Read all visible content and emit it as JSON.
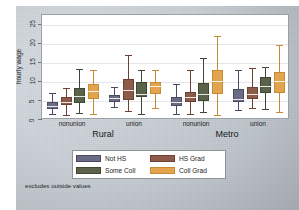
{
  "chart_data": {
    "type": "box",
    "title": "",
    "xlabel": "",
    "ylabel": "hourly wage",
    "ylim": [
      0,
      27.5
    ],
    "yticks": [
      0,
      5,
      10,
      15,
      20,
      25
    ],
    "ytick_labels": [
      "0",
      "5",
      "10",
      "15",
      "20",
      "25"
    ],
    "grid": true,
    "note": "excludes outside values",
    "legend_position": "bottom",
    "group_labels": [
      "nonunion",
      "union",
      "nonunion",
      "union"
    ],
    "super_group_labels": [
      "Rural",
      "Metro"
    ],
    "series": [
      {
        "name": "Not HS",
        "color": "#6b6b86",
        "edge": "#4a4a61",
        "boxes": [
          {
            "group": "Rural / nonunion",
            "whisker_low": 1.6,
            "q1": 2.9,
            "median": 3.6,
            "q3": 4.6,
            "whisker_high": 7.1
          },
          {
            "group": "Rural / union",
            "whisker_low": 3.4,
            "q1": 4.6,
            "median": 5.8,
            "q3": 6.6,
            "whisker_high": 8.7
          },
          {
            "group": "Metro / nonunion",
            "whisker_low": 1.6,
            "q1": 3.6,
            "median": 4.6,
            "q3": 6.1,
            "whisker_high": 9.4
          },
          {
            "group": "Metro / union",
            "whisker_low": 2.7,
            "q1": 4.6,
            "median": 5.6,
            "q3": 8.0,
            "whisker_high": 13.2
          }
        ]
      },
      {
        "name": "HS Grad",
        "color": "#8c5b49",
        "edge": "#6c4133",
        "boxes": [
          {
            "group": "Rural / nonunion",
            "whisker_low": 1.3,
            "q1": 3.8,
            "median": 4.7,
            "q3": 5.9,
            "whisker_high": 8.4
          },
          {
            "group": "Rural / union",
            "whisker_low": 2.4,
            "q1": 5.2,
            "median": 7.8,
            "q3": 10.8,
            "whisker_high": 17.0
          },
          {
            "group": "Metro / nonunion",
            "whisker_low": 1.5,
            "q1": 4.7,
            "median": 5.9,
            "q3": 7.3,
            "whisker_high": 13.1
          },
          {
            "group": "Metro / union",
            "whisker_low": 3.2,
            "q1": 5.6,
            "median": 6.8,
            "q3": 8.7,
            "whisker_high": 13.6
          }
        ]
      },
      {
        "name": "Some Coll",
        "color": "#5a6349",
        "edge": "#3f4733",
        "boxes": [
          {
            "group": "Rural / nonunion",
            "whisker_low": 1.9,
            "q1": 4.5,
            "median": 6.3,
            "q3": 8.5,
            "whisker_high": 13.3
          },
          {
            "group": "Rural / union",
            "whisker_low": 1.7,
            "q1": 5.9,
            "median": 6.8,
            "q3": 9.9,
            "whisker_high": 13.2
          },
          {
            "group": "Metro / nonunion",
            "whisker_low": 2.1,
            "q1": 5.0,
            "median": 6.9,
            "q3": 9.8,
            "whisker_high": 16.3
          },
          {
            "group": "Metro / union",
            "whisker_low": 3.0,
            "q1": 7.2,
            "median": 9.0,
            "q3": 11.2,
            "whisker_high": 14.0
          }
        ]
      },
      {
        "name": "Coll Grad",
        "color": "#e3a44f",
        "edge": "#c78a35",
        "boxes": [
          {
            "group": "Rural / nonunion",
            "whisker_low": 1.7,
            "q1": 5.6,
            "median": 7.7,
            "q3": 9.5,
            "whisker_high": 13.1
          },
          {
            "group": "Rural / union",
            "whisker_low": 3.1,
            "q1": 6.8,
            "median": 8.8,
            "q3": 9.9,
            "whisker_high": 13.0
          },
          {
            "group": "Metro / nonunion",
            "whisker_low": 1.3,
            "q1": 6.8,
            "median": 10.1,
            "q3": 13.2,
            "whisker_high": 22.0
          },
          {
            "group": "Metro / union",
            "whisker_low": 2.0,
            "q1": 7.2,
            "median": 10.1,
            "q3": 12.5,
            "whisker_high": 19.7
          }
        ]
      }
    ]
  },
  "axis": {
    "y_title": "hourly wage"
  },
  "footnote": {
    "text": "excludes outside values"
  }
}
